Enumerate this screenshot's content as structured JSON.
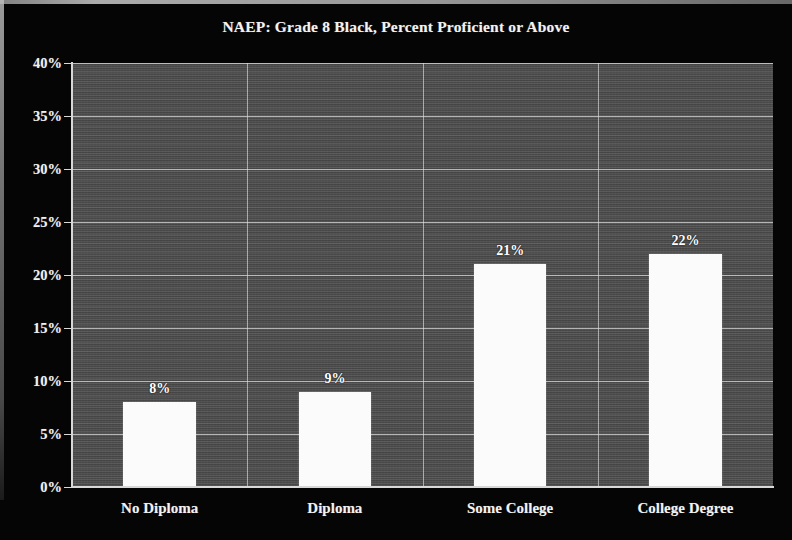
{
  "chart_data": {
    "type": "bar",
    "title": "NAEP: Grade 8 Black, Percent Proficient or Above",
    "categories": [
      "No Diploma",
      "Diploma",
      "Some College",
      "College Degree"
    ],
    "values": [
      8,
      9,
      21,
      22
    ],
    "data_labels": [
      "8%",
      "9%",
      "21%",
      "22%"
    ],
    "xlabel": "",
    "ylabel": "",
    "ylim": [
      0,
      40
    ],
    "ytick_step": 5,
    "ytick_labels": [
      "0%",
      "5%",
      "10%",
      "15%",
      "20%",
      "25%",
      "30%",
      "35%",
      "40%"
    ],
    "ytick_values": [
      0,
      5,
      10,
      15,
      20,
      25,
      30,
      35,
      40
    ],
    "grid": "horizontal-and-vertical",
    "legend": "none",
    "colors": {
      "figure_background": "#050505",
      "plot_background": "#4c4c4c",
      "bar_fill": "#fbfbfb",
      "gridline": "#e4e4e4",
      "axis": "#d8d8d8",
      "text": "#f2f2f2"
    }
  }
}
